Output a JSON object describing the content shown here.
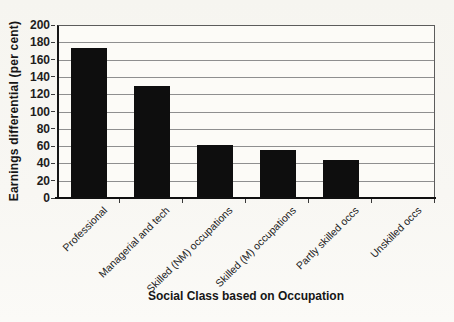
{
  "figure": {
    "background": "#f7f6f2",
    "plot_background": "#fcfbf7",
    "bar_color": "#0e0e0e",
    "grid_color": "#8f8f8f",
    "frame_color": "#5c5c5c",
    "axis_color": "#101010",
    "text_color": "#1d1d1d"
  },
  "chart_data": {
    "type": "bar",
    "title": "",
    "xlabel": "Social Class based on Occupation",
    "ylabel": "Earnings differential (per cent)",
    "categories": [
      "Professional",
      "Managerial and tech",
      "Skilled (NM) occupations",
      "Skilled (M) occupations",
      "Partly skilled occs",
      "Unskilled occs"
    ],
    "values": [
      173,
      130,
      61,
      55,
      44,
      0
    ],
    "ylim": [
      0,
      200
    ],
    "ytick_step": 20,
    "yticks": [
      0,
      20,
      40,
      60,
      80,
      100,
      120,
      140,
      160,
      180,
      200
    ],
    "grid": "horizontal",
    "legend": "none"
  }
}
